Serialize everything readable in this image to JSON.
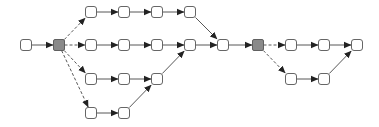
{
  "diagram": {
    "type": "directed-graph",
    "width": 379,
    "height": 127,
    "colors": {
      "background": "#ffffff",
      "node_fill": "#ffffff",
      "node_stroke": "#555555",
      "gateway_fill": "#8a8a8a",
      "gateway_stroke": "#555555",
      "edge_stroke": "#444444",
      "arrow_fill": "#222222"
    },
    "node_size": 11,
    "nodes": [
      {
        "id": "n0",
        "x": 26,
        "y": 45,
        "kind": "task"
      },
      {
        "id": "g1",
        "x": 59,
        "y": 45,
        "kind": "gateway"
      },
      {
        "id": "a1",
        "x": 91,
        "y": 12,
        "kind": "task"
      },
      {
        "id": "a2",
        "x": 124,
        "y": 12,
        "kind": "task"
      },
      {
        "id": "a3",
        "x": 157,
        "y": 12,
        "kind": "task"
      },
      {
        "id": "a4",
        "x": 190,
        "y": 12,
        "kind": "task"
      },
      {
        "id": "b1",
        "x": 91,
        "y": 45,
        "kind": "task"
      },
      {
        "id": "b2",
        "x": 124,
        "y": 45,
        "kind": "task"
      },
      {
        "id": "b3",
        "x": 157,
        "y": 45,
        "kind": "task"
      },
      {
        "id": "b4",
        "x": 190,
        "y": 45,
        "kind": "task"
      },
      {
        "id": "m1",
        "x": 223,
        "y": 45,
        "kind": "task"
      },
      {
        "id": "c1",
        "x": 91,
        "y": 79,
        "kind": "task"
      },
      {
        "id": "c2",
        "x": 124,
        "y": 79,
        "kind": "task"
      },
      {
        "id": "c3",
        "x": 157,
        "y": 79,
        "kind": "task"
      },
      {
        "id": "d1",
        "x": 91,
        "y": 113,
        "kind": "task"
      },
      {
        "id": "d2",
        "x": 124,
        "y": 113,
        "kind": "task"
      },
      {
        "id": "g2",
        "x": 258,
        "y": 45,
        "kind": "gateway"
      },
      {
        "id": "e1",
        "x": 291,
        "y": 45,
        "kind": "task"
      },
      {
        "id": "e2",
        "x": 324,
        "y": 45,
        "kind": "task"
      },
      {
        "id": "e3",
        "x": 357,
        "y": 45,
        "kind": "task"
      },
      {
        "id": "f1",
        "x": 291,
        "y": 79,
        "kind": "task"
      },
      {
        "id": "f2",
        "x": 324,
        "y": 79,
        "kind": "task"
      }
    ],
    "edges": [
      {
        "from": "n0",
        "to": "g1",
        "style": "solid"
      },
      {
        "from": "g1",
        "to": "a1",
        "style": "dashed"
      },
      {
        "from": "g1",
        "to": "b1",
        "style": "dashed"
      },
      {
        "from": "g1",
        "to": "c1",
        "style": "dashed"
      },
      {
        "from": "g1",
        "to": "d1",
        "style": "dashed"
      },
      {
        "from": "a1",
        "to": "a2",
        "style": "solid"
      },
      {
        "from": "a2",
        "to": "a3",
        "style": "solid"
      },
      {
        "from": "a3",
        "to": "a4",
        "style": "solid"
      },
      {
        "from": "a4",
        "to": "m1",
        "style": "solid"
      },
      {
        "from": "b1",
        "to": "b2",
        "style": "solid"
      },
      {
        "from": "b2",
        "to": "b3",
        "style": "solid"
      },
      {
        "from": "b3",
        "to": "b4",
        "style": "solid"
      },
      {
        "from": "b4",
        "to": "m1",
        "style": "solid"
      },
      {
        "from": "c1",
        "to": "c2",
        "style": "solid"
      },
      {
        "from": "c2",
        "to": "c3",
        "style": "solid"
      },
      {
        "from": "c3",
        "to": "b4",
        "style": "solid"
      },
      {
        "from": "d1",
        "to": "d2",
        "style": "solid"
      },
      {
        "from": "d2",
        "to": "c3",
        "style": "solid"
      },
      {
        "from": "m1",
        "to": "g2",
        "style": "solid"
      },
      {
        "from": "g2",
        "to": "e1",
        "style": "dashed"
      },
      {
        "from": "g2",
        "to": "f1",
        "style": "dashed"
      },
      {
        "from": "e1",
        "to": "e2",
        "style": "solid"
      },
      {
        "from": "e2",
        "to": "e3",
        "style": "solid"
      },
      {
        "from": "f1",
        "to": "f2",
        "style": "solid"
      },
      {
        "from": "f2",
        "to": "e3",
        "style": "solid"
      }
    ]
  }
}
